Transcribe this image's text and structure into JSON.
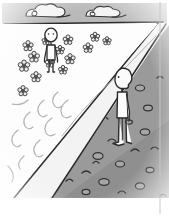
{
  "illustration": {
    "title": "Two figures separated by a diagonal path",
    "caption": "Line drawing: a figure standing in a flowering meadow on the left and a figure standing on rocky ground on the right, divided by a pale diagonal path receding to the horizon.",
    "canvas": {
      "width": 169,
      "height": 216
    },
    "colors": {
      "ink": "#2b2b2b",
      "ink_soft": "#6d6d6d",
      "paper": "#ffffff",
      "sky_band": "#b9b9b9",
      "cloud_fill": "#f4f4f4",
      "meadow": "#fdfdfd",
      "path_band": "#f2f2f2",
      "rock_ground": "#9a9a9a",
      "rock_ground_dark": "#8a8a8a",
      "stone_outline": "#3a3a3a",
      "figure_fill": "#fbfbfb",
      "flower_fill": "#e8e8e8",
      "wave_line": "#b0b0b0",
      "frame_line": "#bdbdbd"
    },
    "regions": [
      {
        "name": "sky",
        "label": "Sky band",
        "tone": "gray"
      },
      {
        "name": "meadow",
        "label": "Flower meadow",
        "tone": "white"
      },
      {
        "name": "path",
        "label": "Pale diagonal path",
        "tone": "light"
      },
      {
        "name": "rocky-ground",
        "label": "Rocky ground",
        "tone": "gray"
      }
    ],
    "clouds": [
      {
        "id": "cloud-left",
        "cx": 45,
        "cy": 13,
        "w": 46,
        "h": 15,
        "curl": "left"
      },
      {
        "id": "cloud-right",
        "cx": 103,
        "cy": 13,
        "w": 42,
        "h": 14,
        "curl": "left"
      }
    ],
    "figures": [
      {
        "id": "figure-meadow",
        "label": "Figure in meadow",
        "facing": "front",
        "x": 51,
        "head_y": 36,
        "height": 36
      },
      {
        "id": "figure-rocks",
        "label": "Figure on rocks",
        "facing": "left-profile",
        "x": 122,
        "head_y": 76,
        "height": 68
      }
    ],
    "flowers": [
      {
        "x": 28,
        "y": 46,
        "r": 4.2
      },
      {
        "x": 68,
        "y": 40,
        "r": 4.0
      },
      {
        "x": 95,
        "y": 37,
        "r": 3.8
      },
      {
        "x": 107,
        "y": 40,
        "r": 3.4
      },
      {
        "x": 34,
        "y": 56,
        "r": 4.4
      },
      {
        "x": 60,
        "y": 50,
        "r": 3.6
      },
      {
        "x": 88,
        "y": 48,
        "r": 4.0
      },
      {
        "x": 24,
        "y": 65,
        "r": 4.6
      },
      {
        "x": 50,
        "y": 62,
        "r": 3.8
      },
      {
        "x": 70,
        "y": 59,
        "r": 4.2
      },
      {
        "x": 36,
        "y": 76,
        "r": 4.2
      },
      {
        "x": 63,
        "y": 70,
        "r": 3.6
      },
      {
        "x": 23,
        "y": 90,
        "r": 4.2
      },
      {
        "x": 46,
        "y": 41,
        "r": 3.2
      }
    ],
    "stones": [
      {
        "x": 131,
        "y": 72,
        "rx": 4.0,
        "ry": 2.6,
        "type": "arc"
      },
      {
        "x": 140,
        "y": 88,
        "rx": 4.6,
        "ry": 3.0,
        "type": "oval"
      },
      {
        "x": 118,
        "y": 96,
        "rx": 3.6,
        "ry": 2.4,
        "type": "arc"
      },
      {
        "x": 148,
        "y": 108,
        "rx": 4.4,
        "ry": 2.8,
        "type": "oval"
      },
      {
        "x": 104,
        "y": 118,
        "rx": 4.0,
        "ry": 2.6,
        "type": "arc"
      },
      {
        "x": 129,
        "y": 122,
        "rx": 3.4,
        "ry": 2.2,
        "type": "oval"
      },
      {
        "x": 92,
        "y": 126,
        "rx": 4.2,
        "ry": 2.8,
        "type": "arc"
      },
      {
        "x": 145,
        "y": 132,
        "rx": 4.8,
        "ry": 3.2,
        "type": "oval"
      },
      {
        "x": 112,
        "y": 140,
        "rx": 3.8,
        "ry": 2.4,
        "type": "arc"
      },
      {
        "x": 78,
        "y": 146,
        "rx": 4.4,
        "ry": 3.0,
        "type": "oval"
      },
      {
        "x": 135,
        "y": 150,
        "rx": 4.0,
        "ry": 2.6,
        "type": "arc"
      },
      {
        "x": 98,
        "y": 156,
        "rx": 5.0,
        "ry": 3.4,
        "type": "oval"
      },
      {
        "x": 62,
        "y": 160,
        "rx": 3.6,
        "ry": 2.4,
        "type": "arc"
      },
      {
        "x": 120,
        "y": 164,
        "rx": 4.6,
        "ry": 3.0,
        "type": "oval"
      },
      {
        "x": 86,
        "y": 172,
        "rx": 4.2,
        "ry": 2.8,
        "type": "arc"
      },
      {
        "x": 150,
        "y": 170,
        "rx": 4.0,
        "ry": 2.6,
        "type": "oval"
      },
      {
        "x": 104,
        "y": 182,
        "rx": 5.2,
        "ry": 3.4,
        "type": "oval"
      },
      {
        "x": 70,
        "y": 180,
        "rx": 3.4,
        "ry": 2.2,
        "type": "arc"
      },
      {
        "x": 140,
        "y": 186,
        "rx": 4.6,
        "ry": 3.2,
        "type": "oval"
      },
      {
        "x": 122,
        "y": 192,
        "rx": 3.8,
        "ry": 2.4,
        "type": "arc"
      },
      {
        "x": 86,
        "y": 192,
        "rx": 4.0,
        "ry": 2.6,
        "type": "oval"
      },
      {
        "x": 155,
        "y": 148,
        "rx": 3.6,
        "ry": 2.4,
        "type": "arc"
      },
      {
        "x": 108,
        "y": 102,
        "rx": 3.2,
        "ry": 2.2,
        "type": "oval"
      }
    ],
    "waves": [
      {
        "id": "wave-1",
        "x": 18,
        "y": 108
      },
      {
        "id": "wave-2",
        "x": 40,
        "y": 100
      },
      {
        "id": "wave-3",
        "x": 62,
        "y": 96
      },
      {
        "id": "wave-4",
        "x": 28,
        "y": 126
      },
      {
        "id": "wave-5",
        "x": 52,
        "y": 120
      },
      {
        "id": "wave-6",
        "x": 14,
        "y": 142
      },
      {
        "id": "wave-7",
        "x": 38,
        "y": 148
      }
    ]
  }
}
